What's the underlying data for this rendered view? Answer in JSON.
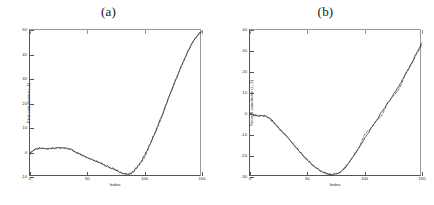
{
  "figure": {
    "background": "#ffffff",
    "line_color_solid": "#1a1a1a",
    "line_color_dashed": "#3a3a3a",
    "axis_color": "#555555"
  },
  "panels": [
    {
      "id": "a",
      "title": "(a)",
      "xlabel": "Index",
      "ylabel": "First coordinate u(:,1)",
      "xticks": [
        "0",
        "50",
        "100",
        "150"
      ],
      "xtick_values": [
        0,
        50,
        100,
        150
      ],
      "yticks": [
        "50",
        "40",
        "30",
        "20",
        "10",
        "0",
        "-10"
      ],
      "ytick_values": [
        50,
        40,
        30,
        20,
        10,
        0,
        -10
      ]
    },
    {
      "id": "b",
      "title": "(b)",
      "xlabel": "Index",
      "ylabel": "Second coordinate u(:,2)",
      "xticks": [
        "0",
        "50",
        "100",
        "150"
      ],
      "xtick_values": [
        0,
        50,
        100,
        150
      ],
      "yticks": [
        "40",
        "30",
        "20",
        "10",
        "0",
        "-10",
        "-20",
        "-30"
      ],
      "ytick_values": [
        40,
        30,
        20,
        10,
        0,
        -10,
        -20,
        -30
      ]
    }
  ],
  "chart_data": [
    {
      "type": "line",
      "panel": "a",
      "title": "(a)",
      "xlabel": "Index",
      "ylabel": "First coordinate u(:,1)",
      "xlim": [
        0,
        150
      ],
      "ylim": [
        -10,
        50
      ],
      "grid": false,
      "legend": null,
      "series": [
        {
          "name": "observed",
          "style": "solid",
          "x": [
            0,
            3,
            6,
            9,
            12,
            15,
            18,
            21,
            24,
            27,
            30,
            33,
            36,
            39,
            42,
            45,
            48,
            51,
            54,
            57,
            60,
            63,
            66,
            69,
            72,
            75,
            78,
            81,
            84,
            87,
            90,
            93,
            96,
            99,
            102,
            105,
            108,
            111,
            114,
            117,
            120,
            123,
            126,
            129,
            132,
            135,
            138,
            141,
            144,
            147,
            150
          ],
          "y": [
            -0.4,
            0.9,
            1.6,
            1.9,
            1.7,
            1.5,
            1.5,
            1.7,
            1.9,
            2.0,
            1.9,
            1.6,
            1.1,
            0.4,
            -0.4,
            -1.1,
            -1.8,
            -2.4,
            -3.0,
            -3.5,
            -4.1,
            -4.7,
            -5.3,
            -5.9,
            -6.5,
            -7.2,
            -7.9,
            -8.5,
            -8.9,
            -8.7,
            -7.8,
            -6.3,
            -4.3,
            -1.9,
            0.8,
            3.8,
            7.0,
            10.4,
            13.9,
            17.5,
            21.2,
            24.8,
            28.4,
            31.9,
            35.3,
            38.5,
            41.5,
            44.2,
            46.5,
            48.3,
            49.6
          ]
        },
        {
          "name": "fitted",
          "style": "dashed",
          "x": [
            0,
            5,
            10,
            15,
            20,
            25,
            30,
            35,
            40,
            45,
            50,
            55,
            60,
            65,
            70,
            75,
            80,
            85,
            90,
            95,
            100,
            105,
            110,
            115,
            120,
            125,
            130,
            135,
            140,
            145,
            150
          ],
          "y": [
            -0.2,
            1.3,
            1.8,
            1.5,
            1.7,
            2.0,
            1.9,
            1.3,
            0.1,
            -1.1,
            -2.2,
            -3.1,
            -4.1,
            -5.2,
            -6.3,
            -7.2,
            -8.4,
            -8.9,
            -7.8,
            -5.2,
            -1.9,
            3.8,
            9.0,
            14.6,
            21.2,
            27.2,
            33.0,
            38.5,
            43.4,
            47.2,
            49.2
          ]
        }
      ]
    },
    {
      "type": "line",
      "panel": "b",
      "title": "(b)",
      "xlabel": "Index",
      "ylabel": "Second coordinate u(:,2)",
      "xlim": [
        0,
        150
      ],
      "ylim": [
        -30,
        40
      ],
      "grid": false,
      "legend": null,
      "series": [
        {
          "name": "observed",
          "style": "solid",
          "x": [
            0,
            3,
            6,
            9,
            12,
            15,
            18,
            21,
            24,
            27,
            30,
            33,
            36,
            39,
            42,
            45,
            48,
            51,
            54,
            57,
            60,
            63,
            66,
            69,
            72,
            75,
            78,
            81,
            84,
            87,
            90,
            93,
            96,
            99,
            102,
            105,
            108,
            111,
            114,
            117,
            120,
            123,
            126,
            129,
            132,
            135,
            138,
            141,
            144,
            147,
            150
          ],
          "y": [
            0.2,
            -0.3,
            -0.8,
            -1.0,
            -0.9,
            -1.4,
            -2.6,
            -4.2,
            -6.0,
            -7.8,
            -9.6,
            -11.4,
            -13.2,
            -15.1,
            -17.0,
            -18.9,
            -20.7,
            -22.4,
            -24.0,
            -25.4,
            -26.6,
            -27.5,
            -28.2,
            -28.6,
            -28.8,
            -28.6,
            -27.9,
            -26.6,
            -24.8,
            -22.6,
            -20.2,
            -17.6,
            -15.0,
            -12.4,
            -9.8,
            -7.2,
            -4.7,
            -2.2,
            0.3,
            2.7,
            5.1,
            7.5,
            10.0,
            12.6,
            15.3,
            18.2,
            21.3,
            24.4,
            27.6,
            30.8,
            33.8
          ]
        },
        {
          "name": "fitted",
          "style": "dashed",
          "x": [
            0,
            5,
            10,
            15,
            20,
            25,
            30,
            35,
            40,
            45,
            50,
            55,
            60,
            65,
            70,
            75,
            80,
            85,
            90,
            95,
            100,
            105,
            110,
            115,
            120,
            125,
            130,
            135,
            140,
            145,
            150
          ],
          "y": [
            0.4,
            -0.9,
            -0.9,
            -1.5,
            -3.4,
            -6.8,
            -9.6,
            -12.6,
            -16.0,
            -18.9,
            -21.8,
            -24.3,
            -26.6,
            -28.0,
            -28.9,
            -28.6,
            -27.3,
            -24.2,
            -20.2,
            -16.0,
            -9.8,
            -7.0,
            -3.4,
            -0.5,
            5.1,
            8.6,
            12.0,
            18.2,
            23.0,
            28.3,
            32.9
          ]
        }
      ]
    }
  ]
}
